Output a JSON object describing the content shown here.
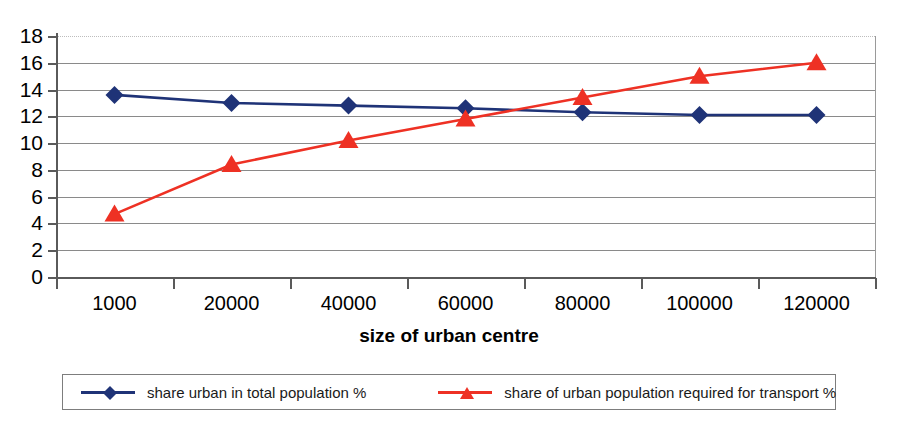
{
  "chart_data": {
    "type": "line",
    "title": "",
    "xlabel": "size of urban centre",
    "ylabel": "",
    "categories": [
      "1000",
      "20000",
      "40000",
      "60000",
      "80000",
      "100000",
      "120000"
    ],
    "ylim": [
      0,
      18
    ],
    "ytick_step": 2,
    "yticks": [
      "18",
      "16",
      "14",
      "12",
      "10",
      "8",
      "6",
      "4",
      "2",
      "0"
    ],
    "grid": true,
    "legend_position": "bottom",
    "series": [
      {
        "name": "share urban in total population %",
        "color": "#1f3377",
        "marker": "diamond",
        "values": [
          13.6,
          13.0,
          12.8,
          12.6,
          12.3,
          12.1,
          12.1
        ]
      },
      {
        "name": "share of urban population required for transport %",
        "color": "#ee3124",
        "marker": "triangle",
        "values": [
          4.7,
          8.4,
          10.2,
          11.8,
          13.4,
          15.0,
          16.0
        ]
      }
    ]
  },
  "axis": {
    "x_title": "size of urban centre"
  },
  "legend": {
    "items": [
      {
        "label": "share urban in total population %",
        "color": "#1f3377",
        "marker": "diamond-marker"
      },
      {
        "label": "share of urban population required for transport %",
        "color": "#ee3124",
        "marker": "triangle-marker"
      }
    ]
  }
}
